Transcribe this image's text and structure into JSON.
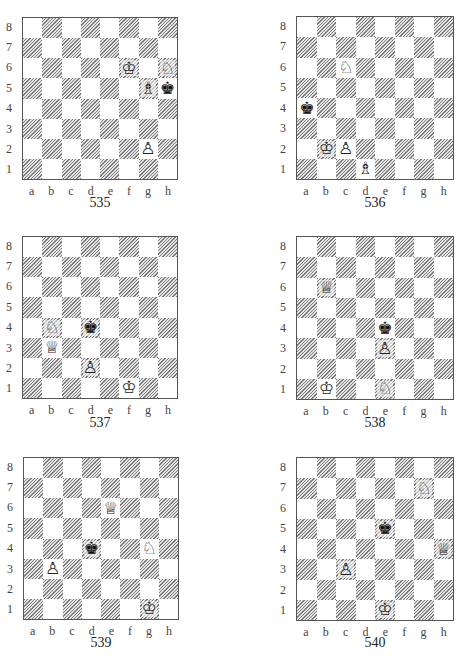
{
  "files": [
    "a",
    "b",
    "c",
    "d",
    "e",
    "f",
    "g",
    "h"
  ],
  "ranks": [
    "8",
    "7",
    "6",
    "5",
    "4",
    "3",
    "2",
    "1"
  ],
  "glyphs": {
    "K": "♔",
    "Q": "♕",
    "R": "♖",
    "B": "♗",
    "N": "♘",
    "P": "♙",
    "k": "♚",
    "q": "♛",
    "r": "♜",
    "b": "♝",
    "n": "♞",
    "p": "♟"
  },
  "diagrams": [
    {
      "number": "535",
      "pieces": [
        {
          "square": "f6",
          "piece": "K",
          "color": "white",
          "name": "white-king"
        },
        {
          "square": "h6",
          "piece": "N",
          "color": "white",
          "name": "white-knight"
        },
        {
          "square": "g5",
          "piece": "B",
          "color": "white",
          "name": "white-bishop"
        },
        {
          "square": "h5",
          "piece": "k",
          "color": "black",
          "name": "black-king"
        },
        {
          "square": "g2",
          "piece": "P",
          "color": "white",
          "name": "white-pawn"
        }
      ]
    },
    {
      "number": "536",
      "pieces": [
        {
          "square": "c6",
          "piece": "N",
          "color": "white",
          "name": "white-knight"
        },
        {
          "square": "a4",
          "piece": "k",
          "color": "black",
          "name": "black-king"
        },
        {
          "square": "b2",
          "piece": "K",
          "color": "white",
          "name": "white-king"
        },
        {
          "square": "c2",
          "piece": "P",
          "color": "white",
          "name": "white-pawn"
        },
        {
          "square": "d1",
          "piece": "B",
          "color": "white",
          "name": "white-bishop"
        }
      ]
    },
    {
      "number": "537",
      "pieces": [
        {
          "square": "b4",
          "piece": "N",
          "color": "white",
          "name": "white-knight"
        },
        {
          "square": "d4",
          "piece": "k",
          "color": "black",
          "name": "black-king"
        },
        {
          "square": "b3",
          "piece": "Q",
          "color": "white",
          "name": "white-queen"
        },
        {
          "square": "d2",
          "piece": "P",
          "color": "white",
          "name": "white-pawn"
        },
        {
          "square": "f1",
          "piece": "K",
          "color": "white",
          "name": "white-king"
        }
      ]
    },
    {
      "number": "538",
      "pieces": [
        {
          "square": "b6",
          "piece": "Q",
          "color": "white",
          "name": "white-queen"
        },
        {
          "square": "e4",
          "piece": "k",
          "color": "black",
          "name": "black-king"
        },
        {
          "square": "e3",
          "piece": "P",
          "color": "white",
          "name": "white-pawn"
        },
        {
          "square": "b1",
          "piece": "K",
          "color": "white",
          "name": "white-king"
        },
        {
          "square": "e1",
          "piece": "N",
          "color": "white",
          "name": "white-knight"
        }
      ]
    },
    {
      "number": "539",
      "pieces": [
        {
          "square": "e6",
          "piece": "Q",
          "color": "white",
          "name": "white-queen"
        },
        {
          "square": "d4",
          "piece": "k",
          "color": "black",
          "name": "black-king"
        },
        {
          "square": "g4",
          "piece": "N",
          "color": "white",
          "name": "white-knight"
        },
        {
          "square": "b3",
          "piece": "P",
          "color": "white",
          "name": "white-pawn"
        },
        {
          "square": "g1",
          "piece": "K",
          "color": "white",
          "name": "white-king"
        }
      ]
    },
    {
      "number": "540",
      "pieces": [
        {
          "square": "g7",
          "piece": "N",
          "color": "white",
          "name": "white-knight"
        },
        {
          "square": "e5",
          "piece": "k",
          "color": "black",
          "name": "black-king"
        },
        {
          "square": "h4",
          "piece": "Q",
          "color": "white",
          "name": "white-queen"
        },
        {
          "square": "c3",
          "piece": "P",
          "color": "white",
          "name": "white-pawn"
        },
        {
          "square": "e1",
          "piece": "K",
          "color": "white",
          "name": "white-king"
        }
      ]
    }
  ]
}
